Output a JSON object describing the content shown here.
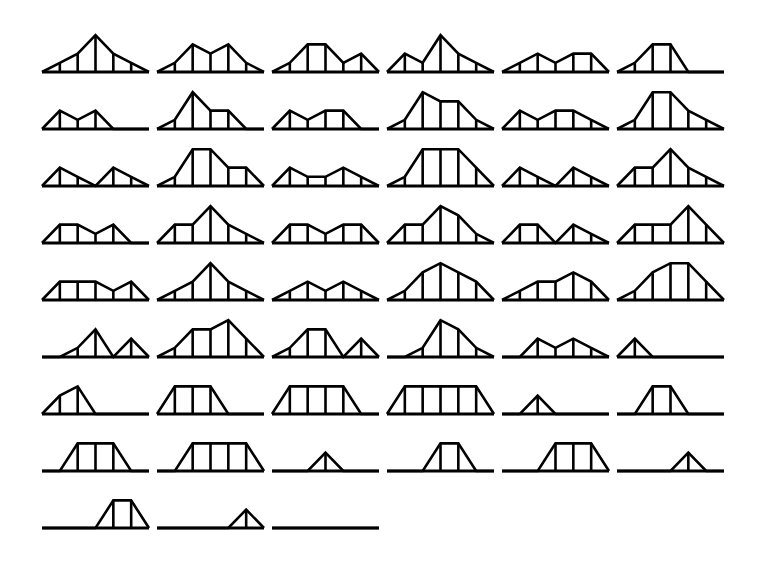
{
  "figure": {
    "panel_count": 51,
    "columns": 6,
    "rows": 9,
    "bins_per_panel": 5,
    "line_color": "#000000",
    "background_color": "#ffffff"
  },
  "chart_data": {
    "type": "line",
    "subtitle": "",
    "xlabel": "",
    "ylabel": "",
    "xlim": [
      0,
      6
    ],
    "ylim": [
      0,
      5
    ],
    "grid": false,
    "legend": "none",
    "categories": [
      "1",
      "2",
      "3",
      "4",
      "5"
    ],
    "panels": [
      {
        "index": 1,
        "row": 1,
        "col": 1,
        "values": [
          1,
          2,
          4,
          2,
          1
        ]
      },
      {
        "index": 2,
        "row": 1,
        "col": 2,
        "values": [
          1,
          3,
          2,
          3,
          1
        ]
      },
      {
        "index": 3,
        "row": 1,
        "col": 3,
        "values": [
          1,
          3,
          3,
          1,
          2
        ]
      },
      {
        "index": 4,
        "row": 1,
        "col": 4,
        "values": [
          2,
          1,
          4,
          2,
          1
        ]
      },
      {
        "index": 5,
        "row": 1,
        "col": 5,
        "values": [
          1,
          2,
          1,
          2,
          2
        ]
      },
      {
        "index": 6,
        "row": 1,
        "col": 6,
        "values": [
          1,
          3,
          3,
          0,
          0
        ]
      },
      {
        "index": 7,
        "row": 2,
        "col": 1,
        "values": [
          2,
          1,
          2,
          0,
          0
        ]
      },
      {
        "index": 8,
        "row": 2,
        "col": 2,
        "values": [
          1,
          4,
          2,
          2,
          0
        ]
      },
      {
        "index": 9,
        "row": 2,
        "col": 3,
        "values": [
          2,
          1,
          2,
          2,
          0
        ]
      },
      {
        "index": 10,
        "row": 2,
        "col": 4,
        "values": [
          1,
          4,
          3,
          3,
          1
        ]
      },
      {
        "index": 11,
        "row": 2,
        "col": 5,
        "values": [
          2,
          1,
          2,
          2,
          1
        ]
      },
      {
        "index": 12,
        "row": 2,
        "col": 6,
        "values": [
          1,
          4,
          4,
          2,
          1
        ]
      },
      {
        "index": 13,
        "row": 3,
        "col": 1,
        "values": [
          2,
          1,
          0,
          2,
          1
        ]
      },
      {
        "index": 14,
        "row": 3,
        "col": 2,
        "values": [
          1,
          4,
          4,
          2,
          2
        ]
      },
      {
        "index": 15,
        "row": 3,
        "col": 3,
        "values": [
          2,
          1,
          1,
          2,
          1
        ]
      },
      {
        "index": 16,
        "row": 3,
        "col": 4,
        "values": [
          1,
          4,
          4,
          4,
          2
        ]
      },
      {
        "index": 17,
        "row": 3,
        "col": 5,
        "values": [
          2,
          1,
          0,
          2,
          1
        ]
      },
      {
        "index": 18,
        "row": 3,
        "col": 6,
        "values": [
          2,
          2,
          4,
          2,
          1
        ]
      },
      {
        "index": 19,
        "row": 4,
        "col": 1,
        "values": [
          2,
          2,
          1,
          2,
          0
        ]
      },
      {
        "index": 20,
        "row": 4,
        "col": 2,
        "values": [
          2,
          2,
          4,
          2,
          1
        ]
      },
      {
        "index": 21,
        "row": 4,
        "col": 3,
        "values": [
          2,
          2,
          1,
          2,
          2
        ]
      },
      {
        "index": 22,
        "row": 4,
        "col": 4,
        "values": [
          2,
          2,
          4,
          3,
          1
        ]
      },
      {
        "index": 23,
        "row": 4,
        "col": 5,
        "values": [
          2,
          2,
          0,
          2,
          1
        ]
      },
      {
        "index": 24,
        "row": 4,
        "col": 6,
        "values": [
          2,
          2,
          2,
          4,
          2
        ]
      },
      {
        "index": 25,
        "row": 5,
        "col": 1,
        "values": [
          2,
          2,
          2,
          1,
          2
        ]
      },
      {
        "index": 26,
        "row": 5,
        "col": 2,
        "values": [
          1,
          2,
          4,
          2,
          1
        ]
      },
      {
        "index": 27,
        "row": 5,
        "col": 3,
        "values": [
          1,
          2,
          1,
          2,
          1
        ]
      },
      {
        "index": 28,
        "row": 5,
        "col": 4,
        "values": [
          1,
          3,
          4,
          3,
          2
        ]
      },
      {
        "index": 29,
        "row": 5,
        "col": 5,
        "values": [
          1,
          2,
          2,
          3,
          2
        ]
      },
      {
        "index": 30,
        "row": 5,
        "col": 6,
        "values": [
          1,
          3,
          4,
          4,
          2
        ]
      },
      {
        "index": 31,
        "row": 6,
        "col": 1,
        "values": [
          0,
          1,
          3,
          0,
          2
        ]
      },
      {
        "index": 32,
        "row": 6,
        "col": 2,
        "values": [
          1,
          3,
          3,
          4,
          2
        ]
      },
      {
        "index": 33,
        "row": 6,
        "col": 3,
        "values": [
          1,
          3,
          3,
          0,
          2
        ]
      },
      {
        "index": 34,
        "row": 6,
        "col": 4,
        "values": [
          0,
          1,
          4,
          3,
          1
        ]
      },
      {
        "index": 35,
        "row": 6,
        "col": 5,
        "values": [
          0,
          2,
          1,
          2,
          1
        ]
      },
      {
        "index": 36,
        "row": 6,
        "col": 6,
        "values": [
          2,
          0,
          0,
          0,
          0
        ]
      },
      {
        "index": 37,
        "row": 7,
        "col": 1,
        "values": [
          2,
          3,
          0,
          0,
          0
        ]
      },
      {
        "index": 38,
        "row": 7,
        "col": 2,
        "values": [
          3,
          3,
          3,
          0,
          0
        ]
      },
      {
        "index": 39,
        "row": 7,
        "col": 3,
        "values": [
          3,
          3,
          3,
          3,
          0
        ]
      },
      {
        "index": 40,
        "row": 7,
        "col": 4,
        "values": [
          3,
          3,
          3,
          3,
          3
        ]
      },
      {
        "index": 41,
        "row": 7,
        "col": 5,
        "values": [
          0,
          2,
          0,
          0,
          0
        ]
      },
      {
        "index": 42,
        "row": 7,
        "col": 6,
        "values": [
          0,
          3,
          3,
          0,
          0
        ]
      },
      {
        "index": 43,
        "row": 8,
        "col": 1,
        "values": [
          0,
          3,
          3,
          3,
          0
        ]
      },
      {
        "index": 44,
        "row": 8,
        "col": 2,
        "values": [
          0,
          3,
          3,
          3,
          3
        ]
      },
      {
        "index": 45,
        "row": 8,
        "col": 3,
        "values": [
          0,
          0,
          2,
          0,
          0
        ]
      },
      {
        "index": 46,
        "row": 8,
        "col": 4,
        "values": [
          0,
          0,
          3,
          3,
          0
        ]
      },
      {
        "index": 47,
        "row": 8,
        "col": 5,
        "values": [
          0,
          0,
          3,
          3,
          3
        ]
      },
      {
        "index": 48,
        "row": 8,
        "col": 6,
        "values": [
          0,
          0,
          0,
          2,
          0
        ]
      },
      {
        "index": 49,
        "row": 9,
        "col": 1,
        "values": [
          0,
          0,
          0,
          3,
          3
        ]
      },
      {
        "index": 50,
        "row": 9,
        "col": 2,
        "values": [
          0,
          0,
          0,
          0,
          2
        ]
      },
      {
        "index": 51,
        "row": 9,
        "col": 3,
        "values": [
          0,
          0,
          0,
          0,
          0
        ]
      }
    ]
  }
}
